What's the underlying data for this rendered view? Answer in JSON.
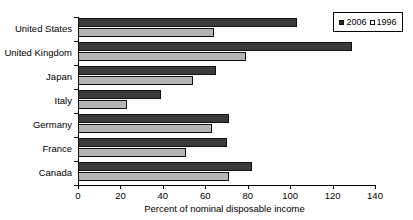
{
  "chart_data": {
    "type": "bar",
    "orientation": "horizontal",
    "title": "",
    "subtitle": "",
    "xlabel": "Percent of nominal disposable income",
    "ylabel": "",
    "xlim": [
      0,
      140
    ],
    "xticks": [
      0,
      20,
      40,
      60,
      80,
      100,
      120,
      140
    ],
    "grid": false,
    "legend_position": "top-right",
    "categories": [
      "United States",
      "United Kingdom",
      "Japan",
      "Italy",
      "Germany",
      "France",
      "Canada"
    ],
    "series": [
      {
        "name": "2006",
        "color": "#3b3b3b",
        "values": [
          103,
          129,
          65,
          39,
          71,
          70,
          82
        ]
      },
      {
        "name": "1996",
        "color": "#b5b5b5",
        "values": [
          64,
          79,
          54,
          23,
          63,
          51,
          71
        ]
      }
    ]
  },
  "legend": {
    "entries": [
      {
        "label": "2006",
        "swatch": "filled-square-icon"
      },
      {
        "label": "1996",
        "swatch": "open-square-icon"
      }
    ]
  },
  "axis": {
    "x_title": "Percent of nominal disposable income",
    "x_tick_labels": [
      "0",
      "20",
      "40",
      "60",
      "80",
      "100",
      "120",
      "140"
    ],
    "y_tick_labels": [
      "United States",
      "United Kingdom",
      "Japan",
      "Italy",
      "Germany",
      "France",
      "Canada"
    ]
  }
}
